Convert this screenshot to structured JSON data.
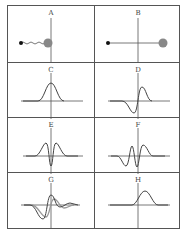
{
  "figure": {
    "panels": [
      {
        "label": "A",
        "type": "particle",
        "description": "small black dot connected by wavy line to large gray ball"
      },
      {
        "label": "B",
        "type": "particle",
        "description": "small black dot connected by straight line to large gray ball"
      },
      {
        "label": "C",
        "type": "waveform",
        "description": "single positive gaussian pulse"
      },
      {
        "label": "D",
        "type": "waveform",
        "description": "negative then positive lobe (first derivative)"
      },
      {
        "label": "E",
        "type": "waveform",
        "description": "two positive lobes with central negative dip"
      },
      {
        "label": "F",
        "type": "waveform",
        "description": "negative, positive, negative, positive oscillation"
      },
      {
        "label": "G",
        "type": "waveform",
        "description": "two overlaid waveforms, black and gray, negative dip then positive peak"
      },
      {
        "label": "H",
        "type": "waveform",
        "description": "single positive pulse shifted right"
      }
    ],
    "colors": {
      "line": "#555555",
      "ball": "#888888",
      "dot": "#111111",
      "gray_trace": "#999999"
    }
  }
}
